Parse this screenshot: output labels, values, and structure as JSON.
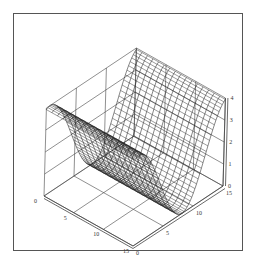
{
  "chart_data": {
    "type": "surface3d",
    "title": "",
    "xlabel": "",
    "ylabel": "",
    "zlabel": "",
    "x_ticks": [
      "0",
      "5",
      "10",
      "15"
    ],
    "y_ticks": [
      "0",
      "5",
      "10",
      "15"
    ],
    "z_ticks": [
      "0",
      "1",
      "2",
      "3",
      "4"
    ],
    "xlim": [
      0,
      15
    ],
    "ylim": [
      0,
      15
    ],
    "zlim": [
      0,
      4
    ],
    "grid": true
  },
  "colors": {
    "line": "#222222",
    "grid": "#444444",
    "frame": "#555555",
    "background": "#ffffff"
  }
}
